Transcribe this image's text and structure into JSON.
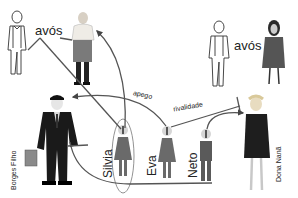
{
  "diagram": {
    "type": "family-relationship-diagram",
    "labels": {
      "grandparents_left": "avós",
      "grandparents_right": "avós",
      "attachment": "apego",
      "rivalry": "rivalidade"
    },
    "people": [
      {
        "id": "avo-left-man",
        "name": "",
        "role": "grandfather"
      },
      {
        "id": "avo-left-woman",
        "name": "",
        "role": "grandmother"
      },
      {
        "id": "avo-right-man",
        "name": "",
        "role": "grandfather"
      },
      {
        "id": "avo-right-woman",
        "name": "",
        "role": "grandmother"
      },
      {
        "id": "borges-filho",
        "name": "Borges Filho",
        "role": "father"
      },
      {
        "id": "silvia",
        "name": "Silvia",
        "role": "child"
      },
      {
        "id": "eva",
        "name": "Eva",
        "role": "child"
      },
      {
        "id": "neto",
        "name": "Neto",
        "role": "child"
      },
      {
        "id": "dona-nana",
        "name": "Dona Nanã",
        "role": "mother"
      }
    ],
    "relations": [
      {
        "from": "avós (left)",
        "to": "silvia",
        "type": "line"
      },
      {
        "from": "silvia",
        "to": "avo-left-woman",
        "type": "arrow"
      },
      {
        "from": "eva",
        "to": "borges-filho",
        "label": "apego",
        "type": "arrow"
      },
      {
        "from": "eva",
        "to": "dona-nana",
        "label": "rivalidade",
        "type": "blocked-arrow"
      },
      {
        "from": "neto",
        "to": "dona-nana",
        "type": "arrow"
      },
      {
        "from": "borges-filho",
        "to": "neto",
        "type": "enclosing-curve"
      }
    ],
    "colors": {
      "line": "#555555",
      "suit": "#1a1a1a",
      "child_figure": "#6a6a6a",
      "dress": "#1e1e1e"
    }
  }
}
